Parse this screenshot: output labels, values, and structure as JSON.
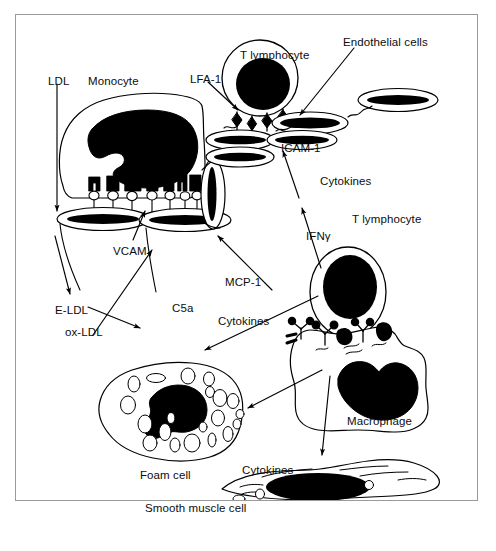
{
  "figure": {
    "frame_color": "#9a9a9a",
    "ink_color": "#000000",
    "background": "#ffffff",
    "caption_fragment": ""
  },
  "labels": [
    {
      "id": "ldl",
      "text": "LDL",
      "x": 48,
      "y": 76
    },
    {
      "id": "monocyte",
      "text": "Monocyte",
      "x": 88,
      "y": 76
    },
    {
      "id": "lfa-1",
      "text": "LFA-1",
      "x": 190,
      "y": 74
    },
    {
      "id": "t-lymphocyte-top",
      "text": "T lymphocyte",
      "x": 240,
      "y": 50
    },
    {
      "id": "endothelial-cells",
      "text": "Endothelial cells",
      "x": 343,
      "y": 37
    },
    {
      "id": "icam-1",
      "text": "ICAM-1",
      "x": 281,
      "y": 143
    },
    {
      "id": "cytokines-top",
      "text": "Cytokines",
      "x": 320,
      "y": 176
    },
    {
      "id": "vcam",
      "text": "VCAM",
      "x": 113,
      "y": 246
    },
    {
      "id": "ifn-gamma",
      "text": "IFNγ",
      "x": 306,
      "y": 231
    },
    {
      "id": "t-lymphocyte-right",
      "text": "T lymphocyte",
      "x": 352,
      "y": 214
    },
    {
      "id": "mcp-1",
      "text": "MCP-1",
      "x": 225,
      "y": 277
    },
    {
      "id": "c5a",
      "text": "C5a",
      "x": 172,
      "y": 303
    },
    {
      "id": "e-ldl",
      "text": "E-LDL",
      "x": 55,
      "y": 305
    },
    {
      "id": "cytokines-mid",
      "text": "Cytokines",
      "x": 218,
      "y": 316
    },
    {
      "id": "ox-ldl",
      "text": "ox-LDL",
      "x": 65,
      "y": 327
    },
    {
      "id": "macrophage",
      "text": "Macrophage",
      "x": 347,
      "y": 416
    },
    {
      "id": "foam-cell",
      "text": "Foam cell",
      "x": 140,
      "y": 470
    },
    {
      "id": "cytokines-bottom",
      "text": "Cytokines",
      "x": 242,
      "y": 465
    },
    {
      "id": "smooth-muscle-cell",
      "text": "Smooth muscle cell",
      "x": 145,
      "y": 503
    }
  ],
  "cells": {
    "monocyte": {
      "name": "Monocyte",
      "nucleus": "kidney-shaped",
      "receptor_count": 7
    },
    "t_lymphocyte_top": {
      "name": "T lymphocyte",
      "shape": "round",
      "adhesion_molecules": 4
    },
    "t_lymphocyte_right": {
      "name": "T lymphocyte",
      "shape": "oval"
    },
    "endothelial_cells": {
      "name": "Endothelial cells",
      "count": 7
    },
    "macrophage": {
      "name": "Macrophage",
      "receptors": 3
    },
    "foam_cell": {
      "name": "Foam cell",
      "lipid_vacuoles": 22
    },
    "smooth_muscle_cell": {
      "name": "Smooth muscle cell",
      "shape": "spindle"
    }
  },
  "mediators": [
    "LDL",
    "E-LDL",
    "ox-LDL",
    "C5a",
    "MCP-1",
    "Cytokines",
    "IFNγ"
  ],
  "adhesion_molecules": [
    "VCAM",
    "ICAM-1",
    "LFA-1"
  ]
}
